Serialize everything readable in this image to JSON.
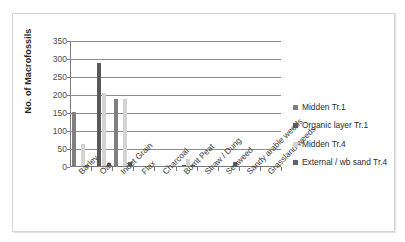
{
  "chart_data": {
    "type": "bar",
    "title": "",
    "xlabel": "",
    "ylabel": "No. of Macrofossils",
    "ylim": [
      0,
      350
    ],
    "yticks": [
      0,
      50,
      100,
      150,
      200,
      250,
      300,
      350
    ],
    "grid": true,
    "legend_position": "right",
    "categories": [
      "Barley",
      "Oat",
      "Indet Grain",
      "Flax",
      "Charcoal",
      "Burnt Peat",
      "Straw / Dung",
      "Seaweed",
      "Sandy arable weeds",
      "Grassland weeds"
    ],
    "series": [
      {
        "name": "Midden Tr.1",
        "color": "#7f7f7f",
        "values": [
          150,
          0,
          186,
          0,
          0,
          0,
          0,
          0,
          0,
          0
        ]
      },
      {
        "name": "Organic layer Tr.1",
        "color": "#595959",
        "values": [
          0,
          287,
          0,
          0,
          0,
          2,
          0,
          0,
          0,
          0
        ]
      },
      {
        "name": "Midden Tr.4",
        "color": "#d3d3d3",
        "values": [
          62,
          203,
          185,
          0,
          3,
          19,
          0,
          0,
          0,
          0
        ]
      },
      {
        "name": "External / wb sand Tr.4",
        "color": "#636363",
        "values": [
          2,
          8,
          10,
          0,
          0,
          2,
          0,
          12,
          0,
          0
        ]
      }
    ]
  },
  "legend": {
    "items": [
      {
        "label": "Midden Tr.1"
      },
      {
        "label": "Organic layer Tr.1"
      },
      {
        "label": "Midden Tr.4"
      },
      {
        "label": "External / wb sand Tr.4"
      }
    ]
  }
}
